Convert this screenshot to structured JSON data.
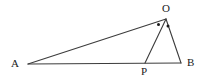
{
  "figure": {
    "type": "geometry-diagram",
    "background_color": "#ffffff",
    "stroke_color": "#3c3c3c",
    "label_color": "#1a1a1a",
    "marker_color": "#1a1a1a",
    "stroke_width": 1.1,
    "points": [
      {
        "name": "A",
        "label": "A",
        "x": 28,
        "y": 64,
        "label_x": 11,
        "label_y": 58
      },
      {
        "name": "B",
        "label": "B",
        "x": 181,
        "y": 63,
        "label_x": 187,
        "label_y": 57
      },
      {
        "name": "O",
        "label": "O",
        "x": 166,
        "y": 19,
        "label_x": 162,
        "label_y": 3
      },
      {
        "name": "P",
        "label": "P",
        "x": 145,
        "y": 63,
        "label_x": 141,
        "label_y": 66
      }
    ],
    "segments": [
      {
        "name": "segment-AB",
        "from": "A",
        "to": "B",
        "x1": 28,
        "y1": 64,
        "x2": 181,
        "y2": 63
      },
      {
        "name": "segment-AO",
        "from": "A",
        "to": "O",
        "x1": 28,
        "y1": 64,
        "x2": 166,
        "y2": 19
      },
      {
        "name": "segment-OB",
        "from": "O",
        "to": "B",
        "x1": 166,
        "y1": 19,
        "x2": 181,
        "y2": 63
      },
      {
        "name": "segment-OP",
        "from": "O",
        "to": "P",
        "x1": 166,
        "y1": 19,
        "x2": 145,
        "y2": 63
      }
    ],
    "angle_markers": [
      {
        "name": "angle-dot-AOP",
        "x": 158.5,
        "y": 24.5,
        "r": 1.5
      },
      {
        "name": "angle-dot-POB",
        "x": 168,
        "y": 26,
        "r": 1.5
      }
    ]
  }
}
